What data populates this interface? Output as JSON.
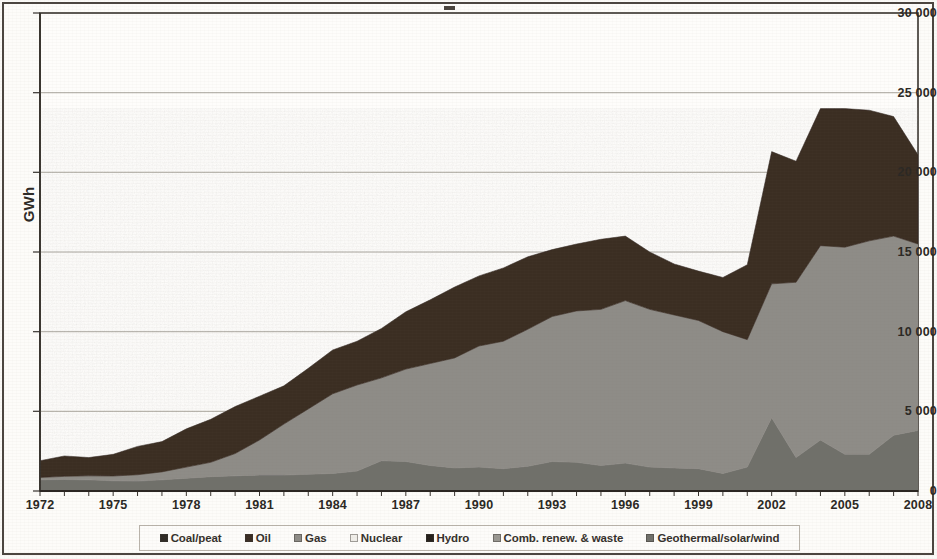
{
  "figure": {
    "background_color": "#fdfcf9",
    "frame_color": "#4b453f"
  },
  "axes": {
    "y_title": "GWh",
    "y_ticks": [
      "30 000",
      "25 000",
      "20 000",
      "15 000",
      "10 000",
      "5 000",
      "0"
    ],
    "x_ticks": [
      "1972",
      "1975",
      "1978",
      "1981",
      "1984",
      "1987",
      "1990",
      "1993",
      "1996",
      "1999",
      "2002",
      "2005",
      "2008"
    ]
  },
  "legend": {
    "items": [
      {
        "label": "Coal/peat",
        "color": "#2f2a25"
      },
      {
        "label": "Oil",
        "color": "#3a2d24"
      },
      {
        "label": "Gas",
        "color": "#8e8c87"
      },
      {
        "label": "Nuclear",
        "color": "#f0eee9"
      },
      {
        "label": "Hydro",
        "color": "#241f1b"
      },
      {
        "label": "Comb. renew. & waste",
        "color": "#9a9892"
      },
      {
        "label": "Geothermal/solar/wind",
        "color": "#70706b"
      }
    ]
  },
  "chart_data": {
    "type": "area",
    "stacked": true,
    "title": "",
    "xlabel": "",
    "ylabel": "GWh",
    "ylim": [
      0,
      30000
    ],
    "xlim": [
      1972,
      2008
    ],
    "grid": true,
    "legend_position": "bottom",
    "x": [
      1972,
      1973,
      1974,
      1975,
      1976,
      1977,
      1978,
      1979,
      1980,
      1981,
      1982,
      1983,
      1984,
      1985,
      1986,
      1987,
      1988,
      1989,
      1990,
      1991,
      1992,
      1993,
      1994,
      1995,
      1996,
      1997,
      1998,
      1999,
      2000,
      2001,
      2002,
      2003,
      2004,
      2005,
      2006,
      2007,
      2008
    ],
    "series": [
      {
        "name": "Hydro",
        "color": "#70706b",
        "values": [
          700,
          720,
          700,
          640,
          620,
          700,
          800,
          900,
          950,
          1000,
          1000,
          1050,
          1100,
          1250,
          1900,
          1850,
          1600,
          1450,
          1500,
          1400,
          1550,
          1850,
          1800,
          1600,
          1750,
          1500,
          1450,
          1400,
          1100,
          1500,
          4600,
          2100,
          3200,
          2300,
          2300,
          3500,
          3800
        ]
      },
      {
        "name": "Gas",
        "color": "#8e8c87",
        "values": [
          150,
          200,
          250,
          300,
          400,
          500,
          700,
          900,
          1400,
          2200,
          3200,
          4100,
          5000,
          5400,
          5200,
          5800,
          6400,
          6900,
          7600,
          8000,
          8600,
          9100,
          9500,
          9800,
          10200,
          9900,
          9600,
          9300,
          8900,
          8000,
          8400,
          11000,
          12200,
          13000,
          13400,
          12500,
          11700
        ]
      },
      {
        "name": "Oil",
        "color": "#3a2d24",
        "values": [
          1050,
          1280,
          1150,
          1360,
          1780,
          1900,
          2400,
          2700,
          2950,
          2750,
          2400,
          2550,
          2750,
          2750,
          3100,
          3600,
          4000,
          4450,
          4400,
          4600,
          4550,
          4200,
          4200,
          4400,
          4050,
          3600,
          3200,
          3100,
          3400,
          4700,
          8300,
          7600,
          8600,
          8700,
          8200,
          7500,
          5600
        ]
      }
    ],
    "totals": {
      "1972": 1900,
      "1980": 5300,
      "1990": 13500,
      "1996": 16000,
      "2001": 14200,
      "2002": 21300,
      "2004": 24000,
      "2008": 21100
    }
  }
}
